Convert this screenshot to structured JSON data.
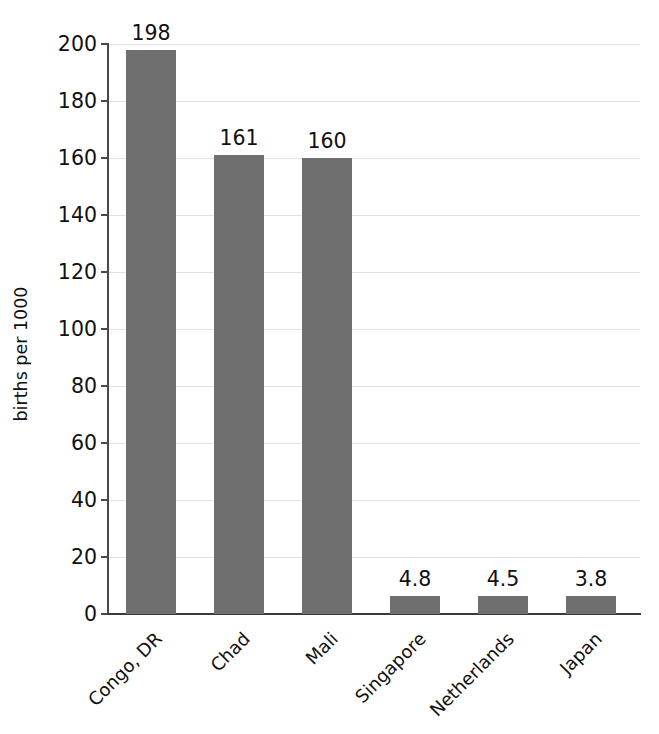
{
  "chart_data": {
    "type": "bar",
    "title": "",
    "xlabel": "",
    "ylabel": "births per 1000",
    "categories": [
      "Congo, DR",
      "Chad",
      "Mali",
      "Singapore",
      "Netherlands",
      "Japan"
    ],
    "values": [
      198,
      161,
      160,
      4.8,
      4.5,
      3.8
    ],
    "value_labels": [
      "198",
      "161",
      "160",
      "4.8",
      "4.5",
      "3.8"
    ],
    "ylim": [
      0,
      200
    ],
    "ytick_step": 20,
    "ytick_labels": [
      "200",
      "180",
      "160",
      "140",
      "120",
      "100",
      "80",
      "60",
      "40",
      "20",
      "0"
    ],
    "ytick_values": [
      200,
      180,
      160,
      140,
      120,
      100,
      80,
      60,
      40,
      20,
      0
    ],
    "grid": "horizontal",
    "legend": "none",
    "bar_color": "#6f6f6f",
    "grid_color": "#e2e2e2",
    "axis_color": "#3a3a3a",
    "text_color": "#111111",
    "category_label_rotation": "-45"
  }
}
